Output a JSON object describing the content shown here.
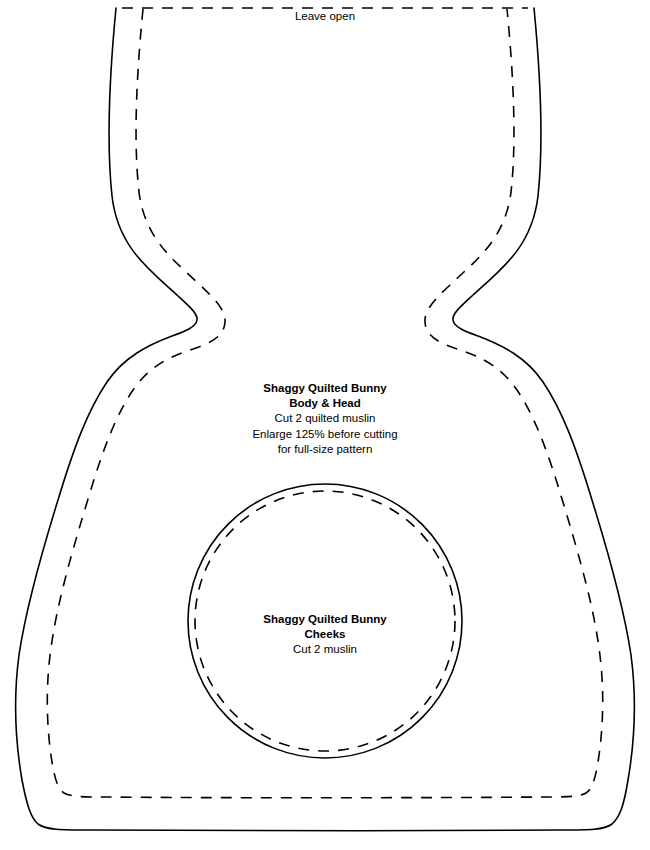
{
  "sheet": {
    "background_color": "#ffffff",
    "line_color": "#000000"
  },
  "notes": {
    "leave_open": "Leave open"
  },
  "pieces": [
    {
      "name": "body-head",
      "title_line_1": "Shaggy Quilted Bunny",
      "title_line_2": "Body & Head",
      "instruction_1": "Cut 2 quilted muslin",
      "instruction_2": "Enlarge 125% before cutting",
      "instruction_3": "for full-size pattern"
    },
    {
      "name": "cheeks",
      "title_line_1": "Shaggy Quilted Bunny",
      "title_line_2": "Cheeks",
      "instruction_1": "Cut 2 muslin"
    }
  ],
  "geometry": {
    "body_cut_path": "M 116 8 C 110 70 106 140 112 196 C 118 248 150 270 178 296 C 190 307 198 314 197 320 C 196 327 186 331 172 336 C 148 345 124 357 107 382 C 88 410 74 447 58 500 C 40 558 26 608 19 655 C 13 700 16 745 22 780 C 27 806 31 818 38 824 C 46 830 62 830 90 830 C 190 831 420 831 560 830 C 590 830 604 830 612 824 C 620 817 624 805 628 780 C 634 745 637 700 631 655 C 624 608 610 558 592 500 C 576 447 562 410 543 382 C 526 357 502 345 478 336 C 464 331 454 327 453 320 C 452 314 460 307 472 296 C 500 270 532 248 538 196 C 544 140 540 70 534 8",
    "body_seam_path": "M 143 9 C 137 70 133 139 139 192 C 145 240 175 261 200 285 C 216 300 226 311 225 322 C 224 338 208 344 190 350 C 168 357 148 368 133 390 C 116 415 103 449 88 499 C 71 555 57 604 51 648 C 45 690 47 731 52 762 C 55 780 58 789 64 793 C 71 797 84 797 106 797 C 200 798 420 798 544 797 C 566 797 579 797 586 793 C 592 789 595 780 598 762 C 603 731 605 690 599 648 C 593 604 579 555 562 499 C 547 449 534 415 517 390 C 502 368 482 357 460 350 C 442 344 426 338 425 322 C 424 311 434 300 450 285 C 475 261 505 240 511 192 C 517 139 513 70 507 9",
    "leave_open_path": "M 122 8 L 528 8",
    "cheek_cut_circle": {
      "cx": 325,
      "cy": 621,
      "r": 137
    },
    "cheek_seam_circle": {
      "cx": 325,
      "cy": 621,
      "r": 130
    }
  }
}
